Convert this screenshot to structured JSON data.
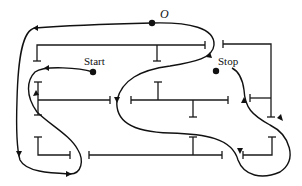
{
  "diagram": {
    "labels": {
      "origin": "O",
      "start": "Start",
      "stop": "Stop"
    },
    "colors": {
      "line": "#111111",
      "background": "#ffffff"
    }
  }
}
